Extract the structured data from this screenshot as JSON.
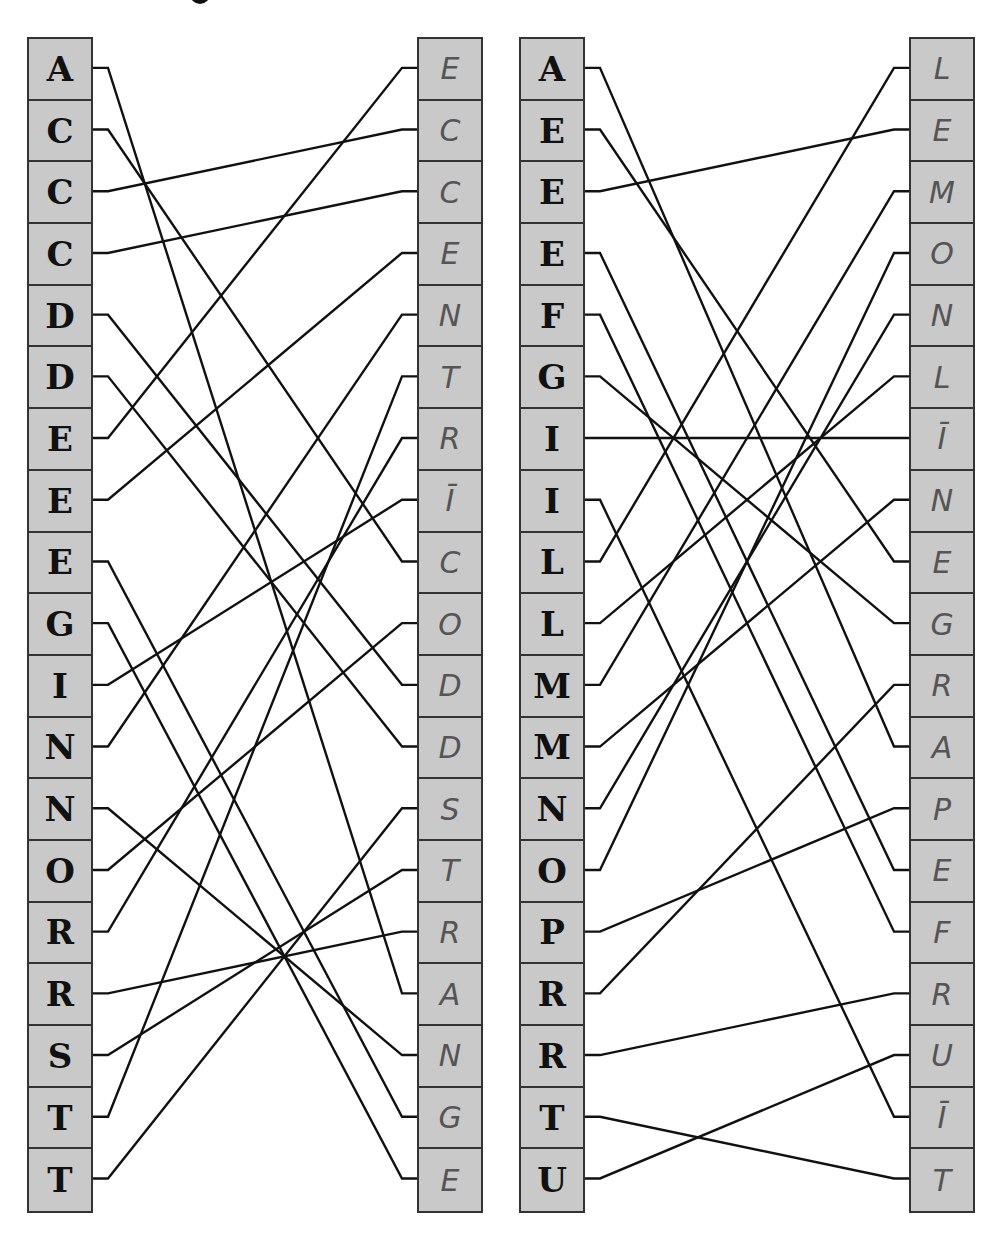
{
  "diagram": {
    "type": "letter-matching",
    "panels": [
      {
        "left_letters": [
          "A",
          "C",
          "C",
          "C",
          "D",
          "D",
          "E",
          "E",
          "E",
          "G",
          "I",
          "N",
          "N",
          "O",
          "R",
          "R",
          "S",
          "T",
          "T"
        ],
        "right_letters": [
          "E",
          "C",
          "C",
          "E",
          "N",
          "T",
          "R",
          "Ī",
          "C",
          "O",
          "D",
          "D",
          "S",
          "T",
          "R",
          "A",
          "N",
          "G",
          "E"
        ],
        "right_word": "ECCENTRIC ODDS TRANGE",
        "connections": [
          [
            0,
            15
          ],
          [
            1,
            8
          ],
          [
            2,
            1
          ],
          [
            3,
            2
          ],
          [
            4,
            10
          ],
          [
            5,
            11
          ],
          [
            6,
            0
          ],
          [
            7,
            3
          ],
          [
            8,
            17
          ],
          [
            9,
            18
          ],
          [
            10,
            7
          ],
          [
            11,
            4
          ],
          [
            12,
            16
          ],
          [
            13,
            9
          ],
          [
            14,
            6
          ],
          [
            15,
            14
          ],
          [
            16,
            13
          ],
          [
            17,
            5
          ],
          [
            18,
            12
          ]
        ]
      },
      {
        "left_letters": [
          "A",
          "E",
          "E",
          "E",
          "F",
          "G",
          "I",
          "I",
          "L",
          "L",
          "M",
          "M",
          "N",
          "O",
          "P",
          "R",
          "R",
          "T",
          "U"
        ],
        "right_letters": [
          "L",
          "E",
          "M",
          "O",
          "N",
          "L",
          "Ī",
          "N",
          "E",
          "G",
          "R",
          "A",
          "P",
          "E",
          "F",
          "R",
          "U",
          "Ī",
          "T"
        ],
        "right_word": "LEMON LINE GRAPEFRUIT",
        "connections": [
          [
            0,
            11
          ],
          [
            1,
            8
          ],
          [
            2,
            1
          ],
          [
            3,
            13
          ],
          [
            4,
            14
          ],
          [
            5,
            9
          ],
          [
            6,
            6
          ],
          [
            7,
            17
          ],
          [
            8,
            0
          ],
          [
            9,
            5
          ],
          [
            10,
            2
          ],
          [
            11,
            7
          ],
          [
            12,
            4
          ],
          [
            13,
            3
          ],
          [
            14,
            12
          ],
          [
            15,
            10
          ],
          [
            16,
            15
          ],
          [
            17,
            18
          ],
          [
            18,
            16
          ]
        ]
      }
    ]
  }
}
